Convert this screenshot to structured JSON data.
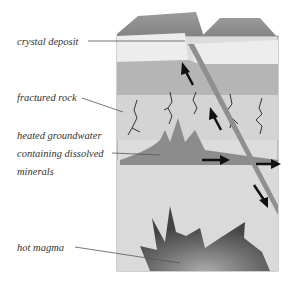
{
  "diagram": {
    "type": "geological cross-section",
    "labels": {
      "crystal_deposit": "crystal deposit",
      "fractured_rock": "fractured rock",
      "groundwater_line1": "heated groundwater",
      "groundwater_line2": "containing dissolved",
      "groundwater_line3": "minerals",
      "hot_magma": "hot magma"
    },
    "arrows": [
      {
        "direction": "up-left",
        "location": "fault upper"
      },
      {
        "direction": "up-left",
        "location": "fault middle"
      },
      {
        "direction": "right",
        "location": "groundwater pool"
      },
      {
        "direction": "right",
        "location": "fault right edge"
      },
      {
        "direction": "down-right",
        "location": "fault lower"
      }
    ],
    "colors": {
      "surface": "#8a8a8a",
      "crystal_layer": "#ececec",
      "upper_rock": "#b4b4b4",
      "fractured_rock": "#d6d6d6",
      "lower_rock": "#dcdcdc",
      "groundwater": "#8c8c8c",
      "magma": "#5a5a5a",
      "fault": "#8f8f8f",
      "arrow": "#111111"
    }
  }
}
